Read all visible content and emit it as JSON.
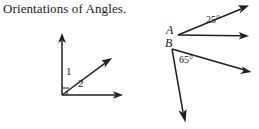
{
  "page": {
    "title": "Orientations of Angles.",
    "background_color": "#ffffff",
    "ink_color": "#231f20",
    "width": 259,
    "height": 129
  },
  "figures": [
    {
      "id": "left-figure",
      "name": "adjacent-angles-figure",
      "description": "Common vertex with vertical ray, diagonal ray and horizontal ray forming angles 1 and 2",
      "vertex": {
        "x": 62,
        "y": 95
      },
      "rays": [
        {
          "name": "vertical-up-ray",
          "from": {
            "x": 62,
            "y": 95
          },
          "to": {
            "x": 62,
            "y": 34
          }
        },
        {
          "name": "diagonal-up-right-ray",
          "from": {
            "x": 62,
            "y": 95
          },
          "to": {
            "x": 111,
            "y": 59
          }
        },
        {
          "name": "horizontal-right-ray",
          "from": {
            "x": 62,
            "y": 95
          },
          "to": {
            "x": 122,
            "y": 95
          }
        }
      ],
      "labels": [
        {
          "name": "angle-1-label",
          "text": "1",
          "x": 66,
          "y": 70
        },
        {
          "name": "angle-2-label",
          "text": "2",
          "x": 78,
          "y": 82
        }
      ]
    },
    {
      "id": "right-figure",
      "name": "points-a-b-angles-figure",
      "description": "Point A with a 25 degree angle and point B with a 65 degree angle",
      "vertices": [
        {
          "name": "vertex-a",
          "label": "A",
          "x": 178,
          "y": 35,
          "label_x": 166,
          "label_y": 26
        },
        {
          "name": "vertex-b",
          "label": "B",
          "x": 172,
          "y": 49,
          "label_x": 165,
          "label_y": 40
        }
      ],
      "rays": [
        {
          "name": "ray-a-upper",
          "from": {
            "x": 178,
            "y": 35
          },
          "to": {
            "x": 248,
            "y": 6
          }
        },
        {
          "name": "ray-a-lower",
          "from": {
            "x": 178,
            "y": 35
          },
          "to": {
            "x": 248,
            "y": 36
          }
        },
        {
          "name": "ray-b-right",
          "from": {
            "x": 172,
            "y": 49
          },
          "to": {
            "x": 251,
            "y": 72
          }
        },
        {
          "name": "ray-b-down",
          "from": {
            "x": 172,
            "y": 49
          },
          "to": {
            "x": 185,
            "y": 122
          }
        }
      ],
      "labels": [
        {
          "name": "angle-25-label",
          "text": "25°",
          "x": 208,
          "y": 18
        },
        {
          "name": "angle-65-label",
          "text": "65°",
          "x": 180,
          "y": 57
        }
      ]
    }
  ]
}
